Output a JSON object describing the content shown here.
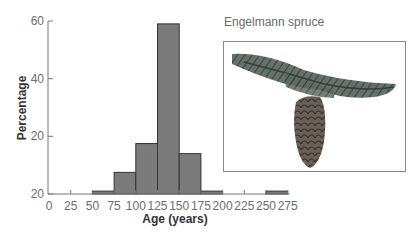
{
  "chart_data": {
    "type": "bar",
    "title": "",
    "xlabel": "Age (years)",
    "ylabel": "Percentage",
    "x_tick_labels": [
      "0",
      "25",
      "50",
      "75",
      "100",
      "125",
      "150",
      "175",
      "200",
      "225",
      "250",
      "275"
    ],
    "x_ticks": [
      0,
      25,
      50,
      75,
      100,
      125,
      150,
      175,
      200,
      225,
      250,
      275
    ],
    "y_ticks": [
      0,
      20,
      40,
      60
    ],
    "y_tick_labels": [
      "20",
      "20",
      "40",
      "60"
    ],
    "xlim": [
      0,
      275
    ],
    "ylim": [
      0,
      60
    ],
    "bins": [
      {
        "start": 50,
        "end": 75,
        "value": 1
      },
      {
        "start": 75,
        "end": 100,
        "value": 7.5
      },
      {
        "start": 100,
        "end": 125,
        "value": 17.5
      },
      {
        "start": 125,
        "end": 150,
        "value": 59
      },
      {
        "start": 150,
        "end": 175,
        "value": 14
      },
      {
        "start": 175,
        "end": 200,
        "value": 1
      },
      {
        "start": 250,
        "end": 275,
        "value": 1
      }
    ],
    "grid": false
  },
  "inset": {
    "title": "Engelmann spruce",
    "image": "spruce-branch-with-cone illustration"
  },
  "colors": {
    "bar_fill": "#7b7b7b",
    "bar_stroke": "#333333",
    "axis": "#777777"
  }
}
